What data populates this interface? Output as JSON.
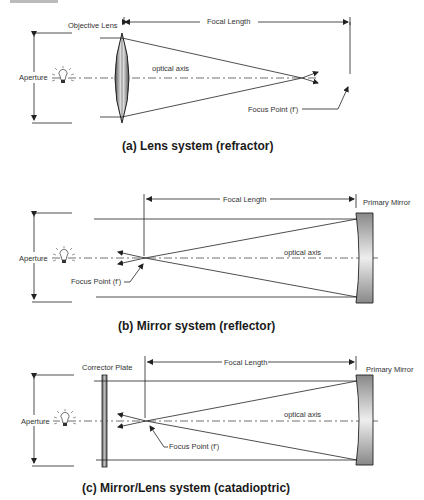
{
  "panels": [
    {
      "id": "a",
      "caption": "(a) Lens system  (refractor)",
      "labels": {
        "element": "Objective Lens",
        "focal_length": "Focal Length",
        "aperture": "Aperture",
        "optical_axis": "optical axis",
        "focus_point": "Focus Point (f')"
      }
    },
    {
      "id": "b",
      "caption": "(b) Mirror system  (reflector)",
      "labels": {
        "element": "Primary Mirror",
        "focal_length": "Focal Length",
        "aperture": "Aperture",
        "optical_axis": "optical axis",
        "focus_point": "Focus Point (f')"
      }
    },
    {
      "id": "c",
      "caption": "(c) Mirror/Lens system (catadioptric)",
      "labels": {
        "element": "Primary Mirror",
        "corrector": "Corrector Plate",
        "focal_length": "Focal Length",
        "aperture": "Aperture",
        "optical_axis": "optical axis",
        "focus_point": "Focus Point (f')"
      }
    }
  ],
  "colors": {
    "line": "#222222",
    "text": "#333333",
    "caption": "#1a1a1a",
    "mirror_dark": "#8a8a8a",
    "mirror_light": "#eeeeee"
  }
}
